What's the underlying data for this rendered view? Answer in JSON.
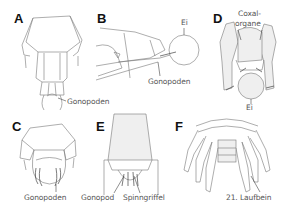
{
  "figure": {
    "background": "#ffffff",
    "line_color": "#777777",
    "label_color": "#555555",
    "panels": [
      {
        "id": "A",
        "letter": "A",
        "labels": [
          "Gonopoden"
        ]
      },
      {
        "id": "B",
        "letter": "B",
        "labels": [
          "Ei",
          "Gonopoden"
        ]
      },
      {
        "id": "C",
        "letter": "C",
        "labels": [
          "Gonopoden"
        ]
      },
      {
        "id": "D",
        "letter": "D",
        "labels": [
          "Coxal-",
          "organe",
          "Ei"
        ]
      },
      {
        "id": "E",
        "letter": "E",
        "labels": [
          "Gonopod",
          "Spinngriffel"
        ]
      },
      {
        "id": "F",
        "letter": "F",
        "labels": [
          "21. Laufbein"
        ]
      }
    ]
  }
}
